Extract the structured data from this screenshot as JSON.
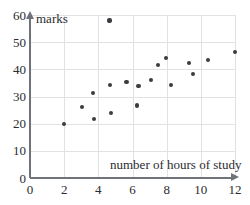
{
  "chart_data": {
    "type": "scatter",
    "title": "",
    "xlabel": "number of hours of study",
    "ylabel": "marks",
    "xlim": [
      0,
      12
    ],
    "ylim": [
      0,
      60
    ],
    "xticks": [
      0,
      2,
      4,
      6,
      8,
      10,
      12
    ],
    "yticks": [
      0,
      10,
      20,
      30,
      40,
      50,
      60
    ],
    "xtick_labels": [
      "0",
      "2",
      "4",
      "6",
      "8",
      "10",
      "12"
    ],
    "ytick_labels": [
      "0",
      "10",
      "20",
      "30",
      "40",
      "50",
      "60"
    ],
    "grid": true,
    "legend": "none",
    "marker": "filled-circle",
    "marker_color": "#3b3b40",
    "grid_color": "#e2e2e4",
    "axis_color": "#6f7278",
    "text_color": "#2b2b2f",
    "points": [
      {
        "x": 2.0,
        "y": 20.0
      },
      {
        "x": 3.05,
        "y": 26.0
      },
      {
        "x": 3.7,
        "y": 31.3
      },
      {
        "x": 3.75,
        "y": 21.6
      },
      {
        "x": 4.65,
        "y": 58.0
      },
      {
        "x": 4.7,
        "y": 34.2
      },
      {
        "x": 4.75,
        "y": 23.9
      },
      {
        "x": 5.65,
        "y": 35.2
      },
      {
        "x": 6.25,
        "y": 26.7
      },
      {
        "x": 6.35,
        "y": 34.0
      },
      {
        "x": 7.1,
        "y": 36.2
      },
      {
        "x": 7.5,
        "y": 41.7
      },
      {
        "x": 7.95,
        "y": 44.2
      },
      {
        "x": 8.25,
        "y": 34.2
      },
      {
        "x": 9.3,
        "y": 42.2
      },
      {
        "x": 9.55,
        "y": 38.2
      },
      {
        "x": 10.4,
        "y": 43.3
      },
      {
        "x": 12.0,
        "y": 46.4
      }
    ]
  }
}
